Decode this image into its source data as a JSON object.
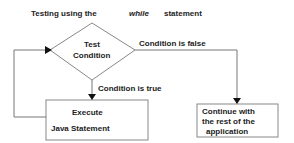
{
  "title": {
    "prefix": "Testing using the",
    "keyword": "while",
    "suffix": "statement"
  },
  "decision": {
    "line1": "Test",
    "line2": "Condition"
  },
  "edges": {
    "false_label": "Condition is false",
    "true_label": "Condition is true"
  },
  "execute_box": {
    "line1": "Execute",
    "line2": "Java Statement"
  },
  "continue_box": {
    "line1": "Continue with",
    "line2": "the rest of the",
    "line3": "application"
  },
  "colors": {
    "line": "#777777",
    "text": "#222222",
    "arrow": "#111111"
  }
}
